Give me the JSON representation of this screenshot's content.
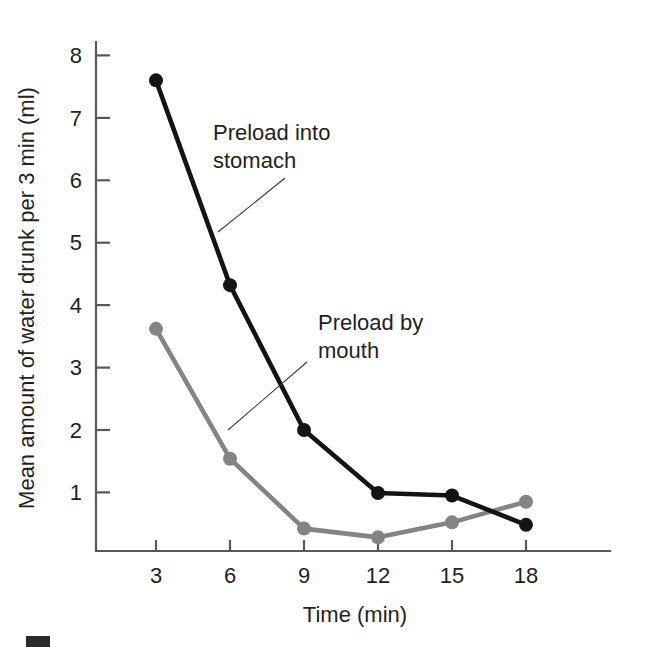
{
  "chart_data": {
    "type": "line",
    "title": "",
    "xlabel": "Time (min)",
    "ylabel": "Mean amount of water drunk per 3 min (ml)",
    "x": [
      3,
      6,
      9,
      12,
      15,
      18
    ],
    "xtick_labels": [
      "3",
      "6",
      "9",
      "12",
      "15",
      "18"
    ],
    "ytick_labels": [
      "1",
      "2",
      "3",
      "4",
      "5",
      "6",
      "7",
      "8"
    ],
    "yticks": [
      1,
      2,
      3,
      4,
      5,
      6,
      7,
      8
    ],
    "xlim": [
      1.5,
      19.5
    ],
    "ylim": [
      0,
      8.6
    ],
    "grid": false,
    "legend_position": "inline-annotations",
    "series": [
      {
        "name": "Preload into stomach",
        "color": "#141414",
        "marker": "circle",
        "values": [
          7.6,
          4.32,
          2.0,
          0.99,
          0.95,
          0.48
        ]
      },
      {
        "name": "Preload by mouth",
        "color": "#848484",
        "marker": "circle",
        "values": [
          3.62,
          1.54,
          0.42,
          0.28,
          0.52,
          0.85
        ]
      }
    ],
    "annotations": [
      {
        "id": "annot-stomach",
        "text_line1": "Preload into",
        "text_line2": "stomach",
        "text_x": 213,
        "text_y": 140,
        "leader_from_x": 285,
        "leader_from_y": 178,
        "leader_to_x": 218,
        "leader_to_y": 232
      },
      {
        "id": "annot-mouth",
        "text_line1": "Preload by",
        "text_line2": "mouth",
        "text_x": 318,
        "text_y": 330,
        "leader_from_x": 307,
        "leader_from_y": 362,
        "leader_to_x": 228,
        "leader_to_y": 430
      }
    ]
  },
  "colors": {
    "dark_series": "#141414",
    "grey_series": "#848484",
    "axis": "#58585a",
    "text": "#231f20",
    "background": "#ffffff",
    "corner_mark": "#2b2b2b"
  },
  "axes": {
    "x_axis_label": "Time (min)",
    "y_axis_label": "Mean amount of water drunk per 3 min (ml)"
  }
}
